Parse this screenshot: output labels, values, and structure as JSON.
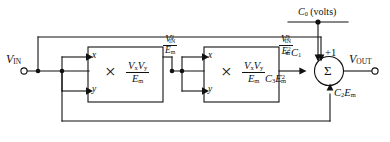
{
  "figure": {
    "type": "block-diagram",
    "background_color": "#ffffff",
    "line_color": "#111111"
  },
  "terminals": {
    "input": {
      "label": "V",
      "sub": "IN",
      "name": "v-in"
    },
    "output": {
      "label": "V",
      "sub": "OUT",
      "name": "v-out"
    }
  },
  "blocks": [
    {
      "name": "multiplier-1",
      "input_x": "x",
      "input_y": "y",
      "operator": "×",
      "numerator": "V",
      "numerator_sub_x": "x",
      "numerator_sub_y": "y",
      "denominator": "E",
      "denominator_sub": "m",
      "formula_numerator": "VxVy",
      "formula_denominator": "Em"
    },
    {
      "name": "multiplier-2",
      "input_x": "x",
      "input_y": "y",
      "operator": "×",
      "numerator": "V",
      "numerator_sub_x": "x",
      "numerator_sub_y": "y",
      "denominator": "E",
      "denominator_sub": "m",
      "formula_numerator": "VxVy",
      "formula_denominator": "Em"
    }
  ],
  "signal_labels": {
    "stage1_out_num_base": "V",
    "stage1_out_num_sub": "IN",
    "stage1_out_num_sup": "2",
    "stage1_out_den_base": "E",
    "stage1_out_den_sub": "m",
    "stage2_out_num_base": "V",
    "stage2_out_num_sub": "IN",
    "stage2_out_num_sup": "3",
    "stage2_out_den_base": "E",
    "stage2_out_den_sub": "m",
    "stage2_out_den_sup": "2"
  },
  "summer": {
    "name": "summing-junction",
    "symbol": "Σ",
    "top_source_label": "C",
    "top_source_sub": "0",
    "top_source_unit": "(volts)",
    "gain_c1": "+C",
    "gain_c1_sub": "1",
    "gain_unity": "+1",
    "gain_c3": "C",
    "gain_c3_sub": "3",
    "gain_c3_e": "E",
    "gain_c3_e_sub": "m",
    "gain_c3_e_sup": "2",
    "gain_c2": "C",
    "gain_c2_sub": "2",
    "gain_c2_e": "E",
    "gain_c2_e_sub": "m"
  }
}
